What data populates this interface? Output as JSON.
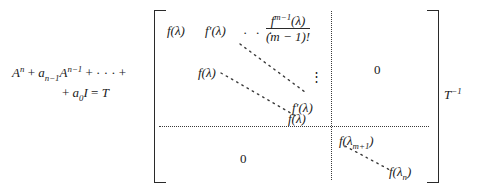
{
  "equation": {
    "lhs": {
      "line1": "Aⁿ + aₙ₋₁Aⁿ⁻¹ + ··· +",
      "line2": "+ a₀I = T",
      "line1_parts": {
        "A": "A",
        "n": "n",
        "plus": "+",
        "a": "a",
        "n_minus_1": "n−1",
        "A2": "A",
        "n_minus_1_exp": "n−1",
        "cdots": "+ · · · +"
      },
      "line2_parts": {
        "plus": "+",
        "a": "a",
        "zero": "0",
        "I": "I",
        "equals": "= ",
        "T": "T"
      }
    },
    "matrix": {
      "top_left_block": {
        "row1": {
          "entry1": "f(λ)",
          "entry2": "f′(λ)",
          "ellipsis": "· · ·",
          "fraction_numerator": "f",
          "fraction_numerator_sup": "m−1",
          "fraction_numerator_arg": "(λ)",
          "fraction_denominator": "(m − 1)!"
        },
        "entry_f_lambda_2": "f(λ)",
        "vertical_dots": "⋮",
        "entry_f_prime_lambda": "f′(λ)",
        "entry_f_lambda_3": "f(λ)"
      },
      "top_right_block": {
        "zero": "0"
      },
      "bottom_left_block": {
        "zero": "0"
      },
      "bottom_right_block": {
        "entry_first": "f(λ",
        "entry_first_sub": "m+1",
        "entry_first_close": ")",
        "entry_last": "f(λ",
        "entry_last_sub": "n",
        "entry_last_close": ")"
      }
    },
    "rhs": {
      "t_inverse": "T",
      "t_inverse_sup": "−1"
    }
  },
  "colors": {
    "background": "#ffffff",
    "ink": "#1a1a1a",
    "rule": "#2a2a2a",
    "dotted": "#3a3a3a"
  }
}
